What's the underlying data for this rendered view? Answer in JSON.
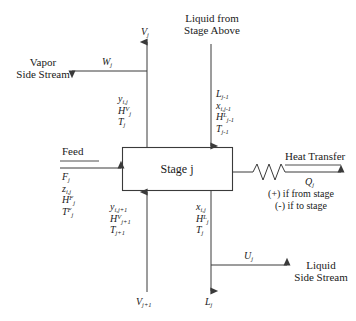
{
  "diagram": {
    "stage_box_label": "Stage j",
    "stroke_color": "#3a3a3a",
    "text_color": "#1a1a1a",
    "background_color": "#ffffff"
  },
  "streams": {
    "vapor_out_top": {
      "arrow_label": "V",
      "arrow_label_sub": "j",
      "properties": [
        {
          "base": "y",
          "sub": "i,j",
          "sup": ""
        },
        {
          "base": "H",
          "sub": "j",
          "sup": "V"
        },
        {
          "base": "T",
          "sub": "j",
          "sup": ""
        }
      ]
    },
    "vapor_side_stream": {
      "caption_line1": "Vapor",
      "caption_line2": "Side Stream",
      "arrow_label": "W",
      "arrow_label_sub": "j"
    },
    "liquid_from_above": {
      "caption_line1": "Liquid from",
      "caption_line2": "Stage Above",
      "properties": [
        {
          "base": "L",
          "sub": "j-1",
          "sup": ""
        },
        {
          "base": "x",
          "sub": "i,j-1",
          "sup": ""
        },
        {
          "base": "H",
          "sub": "j-1",
          "sup": "L"
        },
        {
          "base": "T",
          "sub": "j-1",
          "sup": ""
        }
      ]
    },
    "feed": {
      "caption": "Feed",
      "properties": [
        {
          "base": "F",
          "sub": "j",
          "sup": ""
        },
        {
          "base": "z",
          "sub": "i,j",
          "sup": ""
        },
        {
          "base": "H",
          "sub": "j",
          "sup": "F"
        },
        {
          "base": "T",
          "sub": "j",
          "sup": "F"
        }
      ]
    },
    "heat_transfer": {
      "caption": "Heat Transfer",
      "symbol_base": "Q",
      "symbol_sub": "j",
      "sign_note_line1": "(+) if from stage",
      "sign_note_line2": "(-) if to stage"
    },
    "vapor_in_bottom": {
      "arrow_label": "V",
      "arrow_label_sub": "j+1",
      "properties": [
        {
          "base": "y",
          "sub": "i,j+1",
          "sup": ""
        },
        {
          "base": "H",
          "sub": "j+1",
          "sup": "V"
        },
        {
          "base": "T",
          "sub": "j+1",
          "sup": ""
        }
      ]
    },
    "liquid_out_bottom": {
      "arrow_label": "L",
      "arrow_label_sub": "j",
      "properties": [
        {
          "base": "x",
          "sub": "i,j",
          "sup": ""
        },
        {
          "base": "H",
          "sub": "j",
          "sup": "L"
        },
        {
          "base": "T",
          "sub": "j",
          "sup": ""
        }
      ]
    },
    "liquid_side_stream": {
      "caption_line1": "Liquid",
      "caption_line2": "Side Stream",
      "arrow_label": "U",
      "arrow_label_sub": "j"
    }
  }
}
